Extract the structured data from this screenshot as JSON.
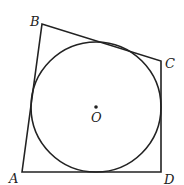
{
  "diagram": {
    "colors": {
      "stroke": "#222222",
      "background": "#ffffff"
    },
    "points": {
      "A": {
        "label": "A",
        "x": 22,
        "y": 172
      },
      "B": {
        "label": "B",
        "x": 42,
        "y": 24
      },
      "C": {
        "label": "C",
        "x": 161,
        "y": 61
      },
      "D": {
        "label": "D",
        "x": 161,
        "y": 172
      },
      "O": {
        "label": "O",
        "x": 96,
        "y": 107
      }
    },
    "circle": {
      "center": "O",
      "radius": 65
    }
  }
}
